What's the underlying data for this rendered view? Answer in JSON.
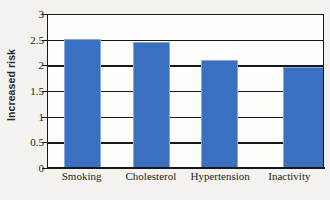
{
  "chart_data": {
    "type": "bar",
    "title": "",
    "xlabel": "",
    "ylabel": "Increased risk",
    "ylim": [
      0,
      3
    ],
    "yticks": [
      "0",
      "0.5",
      "1",
      "1.5",
      "2",
      "2.5",
      "3"
    ],
    "ytick_values": [
      0,
      0.5,
      1,
      1.5,
      2,
      2.5,
      3
    ],
    "grid": true,
    "legend": "none",
    "categories": [
      "Smoking",
      "Cholesterol",
      "Hypertension",
      "Inactivity"
    ],
    "values": [
      2.5,
      2.43,
      2.08,
      1.94
    ],
    "series": [
      {
        "name": "Increased risk",
        "values": [
          2.5,
          2.43,
          2.08,
          1.94
        ],
        "color": "#3b6fc0"
      }
    ]
  },
  "style": {
    "bar_color": "#3b6fc0",
    "bar_outline_color": "#8aa9d8",
    "axis_color": "#15181c",
    "plot_background": "#fdfdfc",
    "page_background": "#f4f2ee",
    "text_color": "#1d1d1d"
  }
}
